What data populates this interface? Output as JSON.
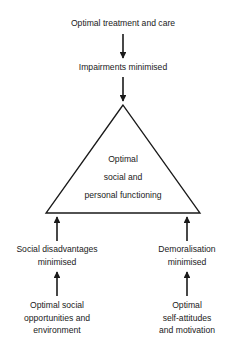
{
  "diagram": {
    "top": {
      "source": "Optimal treatment and care",
      "intermediate": "Impairments minimised"
    },
    "center": {
      "lines": [
        "Optimal",
        "social and",
        "personal functioning"
      ]
    },
    "left": {
      "intermediate": [
        "Social disadvantages",
        "minimised"
      ],
      "source": [
        "Optimal social",
        "opportunities and",
        "environment"
      ]
    },
    "right": {
      "intermediate": [
        "Demoralisation",
        "minimised"
      ],
      "source": [
        "Optimal",
        "self-attitudes",
        "and motivation"
      ]
    },
    "colors": {
      "line": "#1a1a1a",
      "background": "#ffffff"
    }
  }
}
